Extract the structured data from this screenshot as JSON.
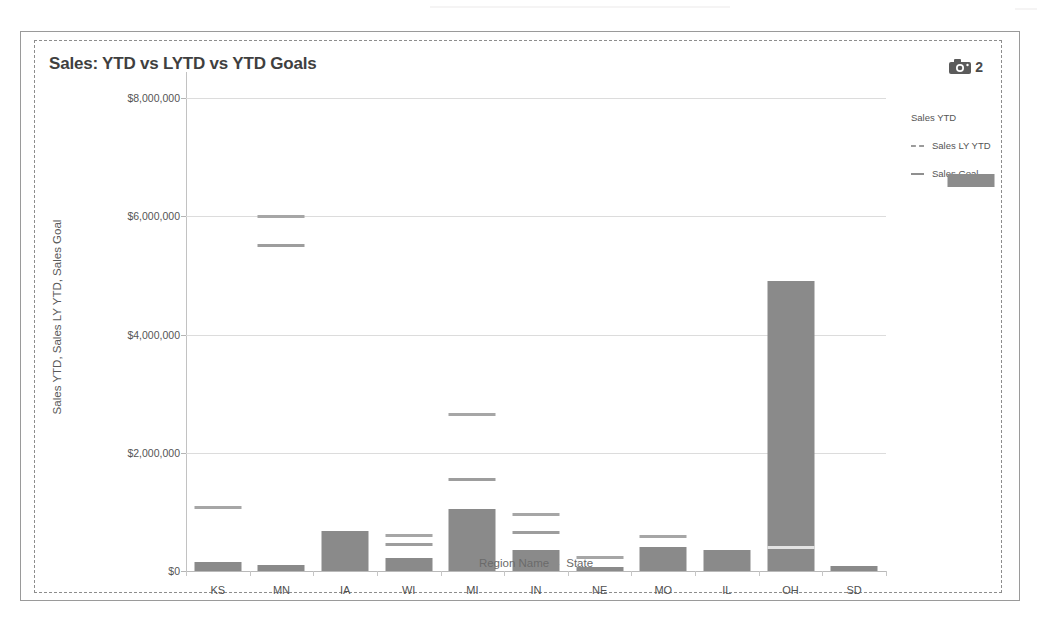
{
  "chart_title": "Sales: YTD vs LYTD vs YTD Goals",
  "snapshot": {
    "icon": "camera-icon",
    "count": "2"
  },
  "legend": {
    "position": "right",
    "items": [
      {
        "label": "Sales YTD",
        "marker": "filled-square",
        "color": "#8a8a8a"
      },
      {
        "label": "Sales LY YTD",
        "marker": "dashed-line",
        "color": "#a6a6a6"
      },
      {
        "label": "Sales Goal",
        "marker": "solid-line",
        "color": "#8f8f8f"
      }
    ]
  },
  "axis": {
    "x_title_primary": "Region Name",
    "x_title_separator": "▸",
    "x_title_secondary": "State",
    "y_title": "Sales YTD, Sales LY YTD, Sales Goal"
  },
  "chart_data": {
    "type": "bar",
    "title": "Sales: YTD vs LYTD vs YTD Goals",
    "xlabel": "Region Name ▸ State",
    "ylabel": "Sales YTD, Sales LY YTD, Sales Goal",
    "ylim": [
      0,
      8000000
    ],
    "yticks": [
      0,
      2000000,
      4000000,
      6000000,
      8000000
    ],
    "ytick_labels": [
      "$0",
      "$2,000,000",
      "$4,000,000",
      "$6,000,000",
      "$8,000,000"
    ],
    "grid": true,
    "legend_position": "right",
    "categories": [
      "KS",
      "MN",
      "IA",
      "WI",
      "MI",
      "IN",
      "NE",
      "MO",
      "IL",
      "OH",
      "SD"
    ],
    "series": [
      {
        "name": "Sales YTD",
        "render": "bar",
        "values": [
          150000,
          110000,
          670000,
          220000,
          1050000,
          350000,
          70000,
          400000,
          360000,
          4900000,
          80000
        ]
      },
      {
        "name": "Sales LY YTD",
        "render": "marker-line",
        "values": [
          1070000,
          6000000,
          null,
          600000,
          2650000,
          950000,
          220000,
          580000,
          null,
          400000,
          null
        ]
      },
      {
        "name": "Sales Goal",
        "render": "marker-line",
        "values": [
          null,
          5500000,
          null,
          450000,
          1550000,
          650000,
          null,
          null,
          null,
          null,
          null
        ]
      }
    ]
  }
}
